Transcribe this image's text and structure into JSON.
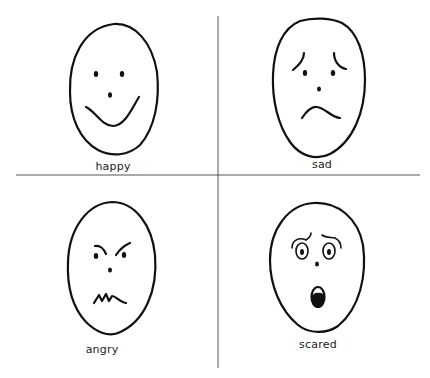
{
  "sheet": {
    "layout": "2x2 grid of hand-drawn emotion faces",
    "colors": {
      "background": "#ffffff",
      "ink": "#111111",
      "divider": "#555555"
    }
  },
  "faces": [
    {
      "id": "happy",
      "label": "happy",
      "expression": "smile, dot eyes, dot nose"
    },
    {
      "id": "sad",
      "label": "sad",
      "expression": "frown, raised inner brows, dot eyes, dot nose"
    },
    {
      "id": "angry",
      "label": "angry",
      "expression": "furrowed brows, zigzag clenched mouth"
    },
    {
      "id": "scared",
      "label": "scared",
      "expression": "wide ringed eyes, arched brows, open oval mouth"
    }
  ]
}
